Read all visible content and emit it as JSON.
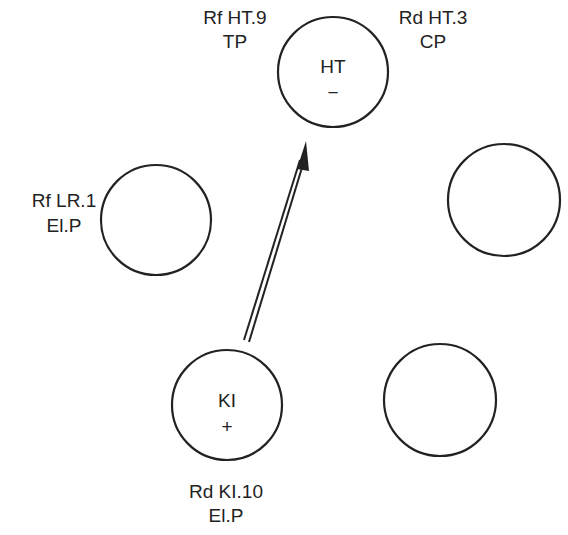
{
  "diagram": {
    "type": "five-element cycle diagram",
    "nodes": [
      {
        "id": "HT",
        "inner_label": "HT",
        "sign": "−",
        "cx": 333,
        "cy": 72,
        "r": 55
      },
      {
        "id": "right",
        "inner_label": "",
        "sign": "",
        "cx": 504,
        "cy": 200,
        "r": 56
      },
      {
        "id": "bottom-right",
        "inner_label": "",
        "sign": "",
        "cx": 440,
        "cy": 400,
        "r": 56
      },
      {
        "id": "KI",
        "inner_label": "KI",
        "sign": "+",
        "cx": 227,
        "cy": 405,
        "r": 55
      },
      {
        "id": "left",
        "inner_label": "",
        "sign": "",
        "cx": 156,
        "cy": 220,
        "r": 55
      }
    ],
    "labels": {
      "ht_left_line1": "Rf HT.9",
      "ht_left_line2": "TP",
      "ht_right_line1": "Rd HT.3",
      "ht_right_line2": "CP",
      "left_line1": "Rf LR.1",
      "left_line2": "El.P",
      "ki_below_line1": "Rd KI.10",
      "ki_below_line2": "El.P"
    },
    "arrow": {
      "from": "KI",
      "to": "HT",
      "style": "double-line arrow"
    }
  }
}
